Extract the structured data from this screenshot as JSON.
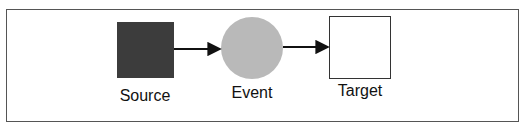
{
  "diagram": {
    "nodes": [
      {
        "id": "source",
        "label": "Source",
        "shape": "square",
        "fill": "#3c3c3c"
      },
      {
        "id": "event",
        "label": "Event",
        "shape": "circle",
        "fill": "#b9b9b9"
      },
      {
        "id": "target",
        "label": "Target",
        "shape": "square",
        "fill": "#ffffff",
        "stroke": "#333333"
      }
    ],
    "edges": [
      {
        "from": "source",
        "to": "event"
      },
      {
        "from": "event",
        "to": "target"
      }
    ]
  }
}
